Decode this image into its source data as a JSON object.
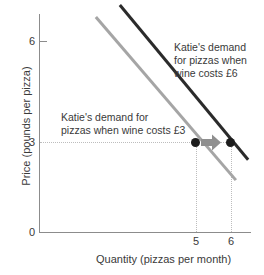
{
  "chart_data": {
    "type": "line",
    "title": "",
    "xlabel": "Quantity (pizzas per month)",
    "ylabel": "Price (pounds per pizza)",
    "xlim": [
      0,
      7
    ],
    "ylim": [
      0,
      7.5
    ],
    "grid": false,
    "legend_position": "inline-annotations",
    "x_ticks": [
      "0",
      "5",
      "6"
    ],
    "y_ticks": [
      "0",
      "3",
      "6"
    ],
    "series": [
      {
        "name": "Katie's demand for pizzas when wine costs £3",
        "color": "#a5a5a5",
        "points": [
          [
            1.9,
            7.2
          ],
          [
            6.5,
            1.75
          ]
        ],
        "highlight_point": [
          5,
          3
        ]
      },
      {
        "name": "Katie's demand for pizzas when wine costs £6",
        "color": "#2b2b2b",
        "points": [
          [
            2.7,
            7.6
          ],
          [
            6.9,
            2.45
          ]
        ],
        "highlight_point": [
          6,
          3
        ]
      }
    ],
    "annotations": [
      {
        "text": "Katie's demand\nfor pizzas when\nwine costs £6",
        "x": 6.0,
        "y": 6.2
      },
      {
        "text": "Katie's demand for\npizzas when wine costs £3",
        "x": 2.4,
        "y": 4.0
      },
      {
        "text": "shift-arrow",
        "from": [
          5,
          3
        ],
        "to": [
          6,
          3
        ]
      }
    ],
    "guide_lines": {
      "horizontal": [
        3
      ],
      "vertical": [
        5,
        6
      ]
    }
  },
  "axes": {
    "y_title": "Price (pounds per pizza)",
    "x_title": "Quantity (pizzas per month)",
    "origin_label": "0",
    "y_tick_labels": {
      "six": "6",
      "three": "3"
    },
    "x_tick_labels": {
      "five": "5",
      "six": "6"
    }
  },
  "annotations": {
    "wine6": "Katie's demand\nfor pizzas when\nwine costs £6",
    "wine3": "Katie's demand for\npizzas when wine costs £3"
  },
  "colors": {
    "demand_wine3": "#a5a5a5",
    "demand_wine6": "#2b2b2b",
    "dot": "#1c1c1c",
    "arrow": "#8f8f8f",
    "axis": "#8c8c8c",
    "guide": "#bdbdbd",
    "text": "#3a3a3a"
  }
}
